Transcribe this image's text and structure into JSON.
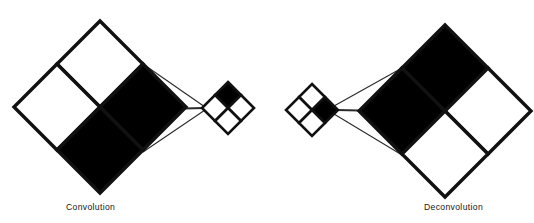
{
  "figure": {
    "background_color": "#ffffff",
    "stroke_color": "#111111",
    "fill_black": "#000000",
    "fill_white": "#ffffff",
    "thin_line_color": "#2a2a2a",
    "panels": [
      {
        "id": "convolution",
        "caption": "Convolution",
        "caption_x": 66,
        "caption_y": 210,
        "direction": "large-to-small",
        "input_grid": {
          "name": "input-feature-map",
          "center_x": 100,
          "center_y": 107,
          "half_diagonal": 86,
          "rows": 2,
          "cols": 2,
          "cell_fill": [
            "white",
            "black",
            "white",
            "black"
          ],
          "stroke_width": 3.4
        },
        "output_grid": {
          "name": "output-feature-map",
          "center_x": 228,
          "center_y": 108,
          "half_diagonal": 26,
          "rows": 2,
          "cols": 2,
          "cell_fill": [
            "black",
            "white",
            "white",
            "white"
          ],
          "stroke_width": 2.6
        },
        "connectors": [
          {
            "x1": 143,
            "y1": 64,
            "x2": 205,
            "y2": 107
          },
          {
            "x1": 162,
            "y1": 109,
            "x2": 205,
            "y2": 108
          },
          {
            "x1": 143,
            "y1": 152,
            "x2": 205,
            "y2": 110
          }
        ]
      },
      {
        "id": "deconvolution",
        "caption": "Deconvolution",
        "caption_x": 424,
        "caption_y": 210,
        "direction": "small-to-large",
        "input_grid": {
          "name": "input-feature-map",
          "center_x": 312,
          "center_y": 110,
          "half_diagonal": 26,
          "rows": 2,
          "cols": 2,
          "cell_fill": [
            "white",
            "black",
            "white",
            "white"
          ],
          "stroke_width": 2.6
        },
        "output_grid": {
          "name": "output-feature-map",
          "center_x": 445,
          "center_y": 111,
          "half_diagonal": 86,
          "rows": 2,
          "cols": 2,
          "cell_fill": [
            "black",
            "white",
            "black",
            "white"
          ],
          "stroke_width": 3.4
        },
        "connectors": [
          {
            "x1": 334,
            "y1": 106,
            "x2": 402,
            "y2": 68
          },
          {
            "x1": 336,
            "y1": 110,
            "x2": 383,
            "y2": 111
          },
          {
            "x1": 334,
            "y1": 114,
            "x2": 402,
            "y2": 155
          }
        ]
      }
    ]
  }
}
